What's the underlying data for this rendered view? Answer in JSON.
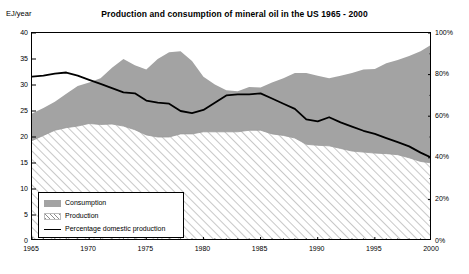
{
  "chart_data": {
    "type": "area",
    "title": "Production and consumption of mineral oil in the US 1965 - 2000",
    "xlabel": "",
    "ylabel": "EJ/year",
    "y2label": "",
    "ylim": [
      0,
      40
    ],
    "y2lim": [
      0,
      100
    ],
    "xlim": [
      1965,
      2000
    ],
    "grid": false,
    "legend_position": "inside-bottom-left",
    "y_ticks": [
      "0",
      "5",
      "10",
      "15",
      "20",
      "25",
      "30",
      "35",
      "40"
    ],
    "y_tick_values": [
      0,
      5,
      10,
      15,
      20,
      25,
      30,
      35,
      40
    ],
    "y2_ticks": [
      "0%",
      "20%",
      "40%",
      "60%",
      "80%",
      "100%"
    ],
    "y2_tick_values": [
      0,
      20,
      40,
      60,
      80,
      100
    ],
    "x_ticks": [
      "1965",
      "1970",
      "1975",
      "1980",
      "1985",
      "1990",
      "1995",
      "2000"
    ],
    "x_tick_values": [
      1965,
      1970,
      1975,
      1980,
      1985,
      1990,
      1995,
      2000
    ],
    "x_minor_tick_step": 1,
    "x": [
      1965,
      1966,
      1967,
      1968,
      1969,
      1970,
      1971,
      1972,
      1973,
      1974,
      1975,
      1976,
      1977,
      1978,
      1979,
      1980,
      1981,
      1982,
      1983,
      1984,
      1985,
      1986,
      1987,
      1988,
      1989,
      1990,
      1991,
      1992,
      1993,
      1994,
      1995,
      1996,
      1997,
      1998,
      1999,
      2000
    ],
    "series": [
      {
        "name": "Consumption",
        "axis": "left",
        "units": "EJ/year",
        "style": "area-gray",
        "color": "#a3a3a3",
        "values": [
          24.5,
          25.6,
          26.8,
          28.3,
          29.8,
          30.5,
          31.3,
          33.3,
          35.0,
          33.8,
          33.0,
          35.0,
          36.3,
          36.5,
          34.6,
          31.6,
          30.1,
          29.0,
          28.8,
          29.6,
          29.5,
          30.5,
          31.3,
          32.3,
          32.3,
          31.8,
          31.3,
          31.8,
          32.3,
          33.0,
          33.1,
          34.2,
          34.8,
          35.6,
          36.5,
          37.8
        ]
      },
      {
        "name": "Production",
        "axis": "left",
        "units": "EJ/year",
        "style": "area-hatched",
        "color": "#8c8c8c",
        "values": [
          19.3,
          20.3,
          21.3,
          21.8,
          22.1,
          22.6,
          22.4,
          22.5,
          22.1,
          21.4,
          20.4,
          20.0,
          20.0,
          20.6,
          20.6,
          21.0,
          21.0,
          21.0,
          21.0,
          21.3,
          21.3,
          20.6,
          20.3,
          19.8,
          18.6,
          18.4,
          18.3,
          17.8,
          17.3,
          17.1,
          16.9,
          16.8,
          16.6,
          16.0,
          15.3,
          15.0
        ]
      },
      {
        "name": "Percentage domestic production",
        "axis": "right",
        "units": "%",
        "style": "line",
        "color": "#000000",
        "values": [
          79.0,
          79.5,
          80.5,
          81.0,
          79.5,
          77.5,
          75.5,
          73.5,
          71.5,
          71.0,
          67.5,
          66.5,
          66.0,
          62.5,
          61.5,
          63.0,
          66.5,
          70.0,
          70.5,
          70.5,
          71.0,
          68.5,
          66.0,
          63.5,
          58.5,
          57.5,
          59.5,
          57.0,
          55.0,
          53.0,
          51.5,
          49.5,
          47.5,
          45.5,
          42.5,
          40.0
        ]
      }
    ]
  },
  "legend": {
    "items": [
      {
        "label": "Consumption",
        "swatch": "gray-fill-swatch"
      },
      {
        "label": "Production",
        "swatch": "hatched-fill-swatch"
      },
      {
        "label": "Percentage domestic production",
        "swatch": "black-line-swatch"
      }
    ]
  }
}
